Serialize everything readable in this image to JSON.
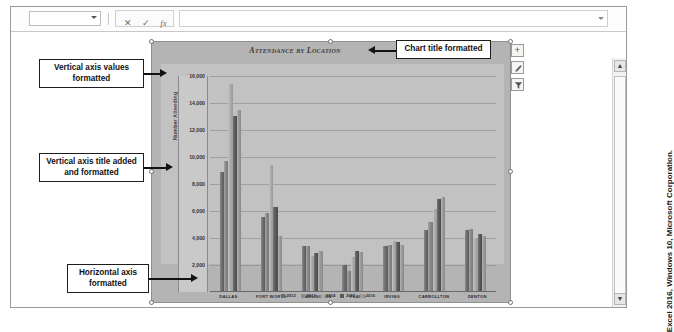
{
  "formula_bar": {
    "name_box_value": "",
    "cancel_label": "✕",
    "confirm_label": "✓",
    "fx_label": "fx",
    "formula_value": "",
    "formula_placeholder": ""
  },
  "chart_buttons": [
    {
      "name": "chart-elements-button",
      "label": "+"
    },
    {
      "name": "chart-styles-button",
      "label": ""
    },
    {
      "name": "chart-filters-button",
      "label": ""
    }
  ],
  "callouts": [
    {
      "name": "callout-vertical-axis-values",
      "text": "Vertical axis values formatted"
    },
    {
      "name": "callout-vertical-axis-title",
      "text": "Vertical axis title added and formatted"
    },
    {
      "name": "callout-horizontal-axis",
      "text": "Horizontal axis formatted"
    },
    {
      "name": "callout-chart-title",
      "text": "Chart title formatted"
    }
  ],
  "credit": "Excel 2016, Windows 10, Microsoft Corporation.",
  "chart_data": {
    "type": "bar",
    "title": "Attendance by Location",
    "xlabel": "",
    "ylabel": "Number Attending",
    "ylim": [
      0,
      16000
    ],
    "ytick_values": [
      2000,
      4000,
      6000,
      8000,
      10000,
      12000,
      14000,
      16000
    ],
    "ytick_labels": [
      "2,000",
      "4,000",
      "6,000",
      "8,000",
      "10,000",
      "12,000",
      "14,000",
      "16,000"
    ],
    "grid": true,
    "legend_position": "bottom",
    "categories": [
      "DALLAS",
      "FORT WORTH",
      "ARLINGTON",
      "PLANO",
      "IRVING",
      "CARROLLTON",
      "DENTON"
    ],
    "series": [
      {
        "name": "2012",
        "values": [
          8800,
          5500,
          3300,
          1900,
          3300,
          4500,
          4500
        ]
      },
      {
        "name": "2013",
        "values": [
          9600,
          5800,
          3300,
          1500,
          3400,
          5100,
          4600
        ]
      },
      {
        "name": "2014",
        "values": [
          15300,
          9300,
          2600,
          2500,
          3700,
          6100,
          3900
        ]
      },
      {
        "name": "2015",
        "values": [
          13000,
          6200,
          2800,
          3000,
          3600,
          6800,
          4200
        ]
      },
      {
        "name": "2016",
        "values": [
          13400,
          4100,
          3000,
          2900,
          3400,
          7000,
          4100
        ]
      }
    ]
  }
}
